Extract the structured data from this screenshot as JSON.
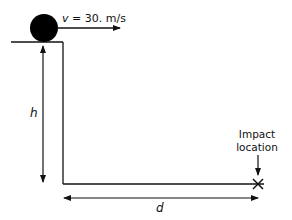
{
  "diagram": {
    "velocity_label": "v = 30. m/s",
    "velocity_var": "v",
    "velocity_value": " = 30. m/s",
    "height_label": "h",
    "distance_label": "d",
    "impact_label_line1": "Impact",
    "impact_label_line2": "location",
    "colors": {
      "ink": "#111111",
      "background": "#ffffff"
    }
  }
}
